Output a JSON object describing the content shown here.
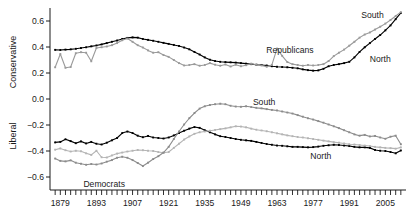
{
  "chart_data": {
    "type": "line",
    "title": "",
    "xlabel": "",
    "ylabel_top": "Conservative",
    "ylabel_bottom": "Liberal",
    "xlim": [
      1875,
      2013
    ],
    "ylim": [
      -0.7,
      0.7
    ],
    "grid": false,
    "legend_position": "inline-annotations",
    "y_ticks": [
      "0.6",
      "0.4",
      "0.2",
      "0.0",
      "-0.2",
      "-0.4",
      "-0.6"
    ],
    "y_tick_values": [
      0.6,
      0.4,
      0.2,
      0.0,
      -0.2,
      -0.4,
      -0.6
    ],
    "x_ticks": [
      "1879",
      "1893",
      "1907",
      "1921",
      "1935",
      "1949",
      "1963",
      "1977",
      "1991",
      "2005"
    ],
    "x_tick_values": [
      1879,
      1893,
      1907,
      1921,
      1935,
      1949,
      1963,
      1977,
      1991,
      2005
    ],
    "x_minor_tick_step": 2,
    "annotations": [
      {
        "text": "Republicans",
        "x": 1968,
        "y": 0.375
      },
      {
        "text": "South",
        "x": 2000,
        "y": 0.645
      },
      {
        "text": "North",
        "x": 2003,
        "y": 0.305
      },
      {
        "text": "Democrats",
        "x": 1896,
        "y": -0.655
      },
      {
        "text": "South",
        "x": 1958,
        "y": -0.025
      },
      {
        "text": "North",
        "x": 1980,
        "y": -0.435
      }
    ],
    "series": [
      {
        "name": "Republicans North",
        "group": "Republicans",
        "region": "North",
        "color": "#000000",
        "markers": true,
        "x": [
          1877,
          1879,
          1881,
          1883,
          1885,
          1887,
          1889,
          1891,
          1893,
          1895,
          1897,
          1899,
          1901,
          1903,
          1905,
          1907,
          1909,
          1911,
          1913,
          1915,
          1917,
          1919,
          1921,
          1923,
          1925,
          1927,
          1929,
          1931,
          1933,
          1935,
          1937,
          1939,
          1941,
          1943,
          1945,
          1947,
          1949,
          1951,
          1953,
          1955,
          1957,
          1959,
          1961,
          1963,
          1965,
          1967,
          1969,
          1971,
          1973,
          1975,
          1977,
          1979,
          1981,
          1983,
          1985,
          1987,
          1989,
          1991,
          1993,
          1995,
          1997,
          1999,
          2001,
          2003,
          2005,
          2007,
          2009,
          2011
        ],
        "values": [
          0.378,
          0.377,
          0.38,
          0.382,
          0.386,
          0.392,
          0.398,
          0.405,
          0.412,
          0.42,
          0.43,
          0.44,
          0.45,
          0.462,
          0.47,
          0.474,
          0.472,
          0.462,
          0.455,
          0.448,
          0.44,
          0.432,
          0.424,
          0.416,
          0.408,
          0.396,
          0.382,
          0.362,
          0.342,
          0.32,
          0.302,
          0.292,
          0.286,
          0.284,
          0.282,
          0.28,
          0.276,
          0.272,
          0.268,
          0.264,
          0.262,
          0.258,
          0.252,
          0.248,
          0.246,
          0.244,
          0.24,
          0.236,
          0.228,
          0.222,
          0.218,
          0.22,
          0.232,
          0.252,
          0.262,
          0.268,
          0.276,
          0.286,
          0.32,
          0.362,
          0.398,
          0.43,
          0.462,
          0.492,
          0.528,
          0.566,
          0.614,
          0.662
        ]
      },
      {
        "name": "Republicans South",
        "group": "Republicans",
        "region": "South",
        "color": "#9a9a9a",
        "markers": true,
        "x": [
          1877,
          1879,
          1881,
          1883,
          1885,
          1887,
          1889,
          1891,
          1893,
          1895,
          1897,
          1899,
          1901,
          1903,
          1905,
          1907,
          1909,
          1911,
          1913,
          1915,
          1917,
          1919,
          1921,
          1923,
          1925,
          1927,
          1929,
          1931,
          1933,
          1935,
          1937,
          1939,
          1941,
          1943,
          1945,
          1947,
          1949,
          1951,
          1953,
          1955,
          1957,
          1959,
          1961,
          1963,
          1965,
          1967,
          1969,
          1971,
          1973,
          1975,
          1977,
          1979,
          1981,
          1983,
          1985,
          1987,
          1989,
          1991,
          1993,
          1995,
          1997,
          1999,
          2001,
          2003,
          2005,
          2007,
          2009,
          2011
        ],
        "values": [
          0.244,
          0.346,
          0.24,
          0.246,
          0.352,
          0.36,
          0.356,
          0.29,
          0.392,
          0.398,
          0.404,
          0.414,
          0.43,
          0.452,
          0.465,
          0.44,
          0.414,
          0.396,
          0.374,
          0.356,
          0.36,
          0.338,
          0.324,
          0.3,
          0.276,
          0.258,
          0.262,
          0.268,
          0.256,
          0.262,
          0.276,
          0.264,
          0.256,
          0.266,
          0.25,
          0.264,
          0.252,
          0.26,
          0.272,
          0.264,
          0.258,
          0.248,
          0.262,
          0.388,
          0.332,
          0.284,
          0.268,
          0.262,
          0.256,
          0.262,
          0.258,
          0.262,
          0.268,
          0.292,
          0.33,
          0.356,
          0.38,
          0.41,
          0.44,
          0.472,
          0.496,
          0.512,
          0.534,
          0.556,
          0.58,
          0.608,
          0.638,
          0.668
        ]
      },
      {
        "name": "Democrats North",
        "group": "Democrats",
        "region": "North",
        "color": "#000000",
        "markers": true,
        "x": [
          1877,
          1879,
          1881,
          1883,
          1885,
          1887,
          1889,
          1891,
          1893,
          1895,
          1897,
          1899,
          1901,
          1903,
          1905,
          1907,
          1909,
          1911,
          1913,
          1915,
          1917,
          1919,
          1921,
          1923,
          1925,
          1927,
          1929,
          1931,
          1933,
          1935,
          1937,
          1939,
          1941,
          1943,
          1945,
          1947,
          1949,
          1951,
          1953,
          1955,
          1957,
          1959,
          1961,
          1963,
          1965,
          1967,
          1969,
          1971,
          1973,
          1975,
          1977,
          1979,
          1981,
          1983,
          1985,
          1987,
          1989,
          1991,
          1993,
          1995,
          1997,
          1999,
          2001,
          2003,
          2005,
          2007,
          2009,
          2011
        ],
        "values": [
          -0.334,
          -0.33,
          -0.31,
          -0.324,
          -0.34,
          -0.326,
          -0.342,
          -0.33,
          -0.344,
          -0.35,
          -0.336,
          -0.318,
          -0.3,
          -0.262,
          -0.25,
          -0.262,
          -0.282,
          -0.294,
          -0.284,
          -0.296,
          -0.3,
          -0.304,
          -0.296,
          -0.28,
          -0.262,
          -0.244,
          -0.228,
          -0.216,
          -0.222,
          -0.24,
          -0.256,
          -0.272,
          -0.286,
          -0.292,
          -0.3,
          -0.308,
          -0.314,
          -0.318,
          -0.322,
          -0.33,
          -0.338,
          -0.346,
          -0.352,
          -0.358,
          -0.36,
          -0.364,
          -0.368,
          -0.368,
          -0.37,
          -0.372,
          -0.37,
          -0.366,
          -0.36,
          -0.356,
          -0.352,
          -0.354,
          -0.358,
          -0.362,
          -0.368,
          -0.372,
          -0.372,
          -0.376,
          -0.392,
          -0.398,
          -0.4,
          -0.408,
          -0.418,
          -0.396
        ]
      },
      {
        "name": "Democrats middle",
        "group": "Democrats",
        "region": "Middle",
        "color": "#b4b4b4",
        "markers": true,
        "x": [
          1877,
          1879,
          1881,
          1883,
          1885,
          1887,
          1889,
          1891,
          1893,
          1895,
          1897,
          1899,
          1901,
          1903,
          1905,
          1907,
          1909,
          1911,
          1913,
          1915,
          1917,
          1919,
          1921,
          1923,
          1925,
          1927,
          1929,
          1931,
          1933,
          1935,
          1937,
          1939,
          1941,
          1943,
          1945,
          1947,
          1949,
          1951,
          1953,
          1955,
          1957,
          1959,
          1961,
          1963,
          1965,
          1967,
          1969,
          1971,
          1973,
          1975,
          1977,
          1979,
          1981,
          1983,
          1985,
          1987,
          1989,
          1991,
          1993,
          1995,
          1997,
          1999,
          2001,
          2003,
          2005,
          2007,
          2009,
          2011
        ],
        "values": [
          -0.39,
          -0.38,
          -0.394,
          -0.404,
          -0.398,
          -0.402,
          -0.418,
          -0.43,
          -0.398,
          -0.448,
          -0.45,
          -0.434,
          -0.42,
          -0.412,
          -0.404,
          -0.398,
          -0.392,
          -0.394,
          -0.398,
          -0.4,
          -0.408,
          -0.414,
          -0.408,
          -0.376,
          -0.344,
          -0.312,
          -0.288,
          -0.268,
          -0.256,
          -0.25,
          -0.244,
          -0.238,
          -0.232,
          -0.226,
          -0.218,
          -0.21,
          -0.212,
          -0.218,
          -0.228,
          -0.236,
          -0.242,
          -0.248,
          -0.256,
          -0.264,
          -0.272,
          -0.28,
          -0.286,
          -0.292,
          -0.296,
          -0.302,
          -0.308,
          -0.314,
          -0.32,
          -0.326,
          -0.332,
          -0.336,
          -0.342,
          -0.348,
          -0.35,
          -0.354,
          -0.358,
          -0.362,
          -0.368,
          -0.372,
          -0.376,
          -0.378,
          -0.382,
          -0.372
        ]
      },
      {
        "name": "Democrats South",
        "group": "Democrats",
        "region": "South",
        "color": "#8c8c8c",
        "markers": true,
        "x": [
          1877,
          1879,
          1881,
          1883,
          1885,
          1887,
          1889,
          1891,
          1893,
          1895,
          1897,
          1899,
          1901,
          1903,
          1905,
          1907,
          1909,
          1911,
          1913,
          1915,
          1917,
          1919,
          1921,
          1923,
          1925,
          1927,
          1929,
          1931,
          1933,
          1935,
          1937,
          1939,
          1941,
          1943,
          1945,
          1947,
          1949,
          1951,
          1953,
          1955,
          1957,
          1959,
          1961,
          1963,
          1965,
          1967,
          1969,
          1971,
          1973,
          1975,
          1977,
          1979,
          1981,
          1983,
          1985,
          1987,
          1989,
          1991,
          1993,
          1995,
          1997,
          1999,
          2001,
          2003,
          2005,
          2007,
          2009,
          2011
        ],
        "values": [
          -0.458,
          -0.476,
          -0.48,
          -0.472,
          -0.49,
          -0.498,
          -0.506,
          -0.5,
          -0.504,
          -0.496,
          -0.482,
          -0.47,
          -0.452,
          -0.444,
          -0.452,
          -0.47,
          -0.492,
          -0.516,
          -0.49,
          -0.462,
          -0.44,
          -0.412,
          -0.368,
          -0.308,
          -0.25,
          -0.196,
          -0.148,
          -0.108,
          -0.074,
          -0.056,
          -0.046,
          -0.04,
          -0.036,
          -0.04,
          -0.052,
          -0.058,
          -0.06,
          -0.056,
          -0.062,
          -0.068,
          -0.072,
          -0.078,
          -0.084,
          -0.088,
          -0.096,
          -0.104,
          -0.112,
          -0.124,
          -0.136,
          -0.148,
          -0.158,
          -0.17,
          -0.182,
          -0.196,
          -0.21,
          -0.224,
          -0.24,
          -0.256,
          -0.272,
          -0.282,
          -0.276,
          -0.288,
          -0.284,
          -0.296,
          -0.306,
          -0.29,
          -0.282,
          -0.348
        ]
      }
    ]
  }
}
